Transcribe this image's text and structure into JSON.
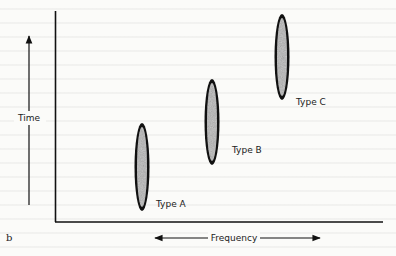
{
  "figure": {
    "panel_label": "b",
    "y_axis_label": "Time",
    "x_axis_label": "Frequency",
    "ellipse_fill": "#a8a8a8",
    "ellipse_stroke": "#111111",
    "types": [
      {
        "label": "Type A",
        "cx": 142,
        "cy": 167,
        "rx": 7,
        "ry": 44
      },
      {
        "label": "Type B",
        "cx": 212,
        "cy": 122,
        "rx": 7,
        "ry": 43
      },
      {
        "label": "Type C",
        "cx": 282,
        "cy": 70,
        "rx": 7,
        "ry": 43
      }
    ]
  }
}
